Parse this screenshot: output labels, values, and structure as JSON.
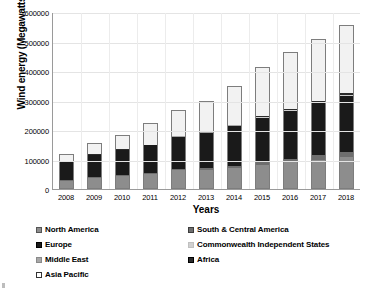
{
  "chart_data": {
    "type": "bar",
    "stacked": true,
    "title": "",
    "xlabel": "Years",
    "ylabel": "Wind energy (Megawatts)",
    "categories": [
      "2008",
      "2009",
      "2010",
      "2011",
      "2012",
      "2013",
      "2014",
      "2015",
      "2016",
      "2017",
      "2018"
    ],
    "ylim": [
      0,
      600000
    ],
    "yticks": [
      "0",
      "100000",
      "200000",
      "300000",
      "400000",
      "500000",
      "600000"
    ],
    "ytick_values": [
      0,
      100000,
      200000,
      300000,
      400000,
      500000,
      600000
    ],
    "grid": "horizontal-and-vertical",
    "legend_position": "below",
    "series": [
      {
        "name": "North America",
        "color": "#8d8d8d",
        "values": [
          25200,
          35600,
          40900,
          48300,
          60900,
          61500,
          68300,
          79500,
          88100,
          95800,
          103600
        ]
      },
      {
        "name": "South & Central America",
        "color": "#6e6e6e",
        "values": [
          600,
          900,
          1900,
          2500,
          3400,
          4800,
          6500,
          8900,
          11700,
          15200,
          19400
        ]
      },
      {
        "name": "Europe",
        "color": "#1a1a1a",
        "values": [
          64900,
          76200,
          86300,
          93700,
          109800,
          121000,
          136000,
          150000,
          163000,
          178000,
          189000
        ]
      },
      {
        "name": "Commonwealth Independent States",
        "color": "#d0d0d0",
        "values": [
          400,
          400,
          400,
          400,
          500,
          600,
          700,
          800,
          900,
          1200,
          1700
        ]
      },
      {
        "name": "Middle East",
        "color": "#a8a8a8",
        "values": [
          200,
          300,
          400,
          500,
          600,
          700,
          800,
          900,
          1000,
          1200,
          1400
        ]
      },
      {
        "name": "Africa",
        "color": "#2b2b2b",
        "values": [
          600,
          800,
          1100,
          1300,
          1500,
          2100,
          2800,
          3400,
          3900,
          4900,
          5700
        ]
      },
      {
        "name": "Asia Pacific",
        "color": "#f2f2f2",
        "values": [
          21400,
          34100,
          46200,
          70800,
          85000,
          102000,
          127000,
          165000,
          188000,
          207000,
          230000
        ]
      }
    ],
    "totals": [
      113300,
      148300,
      177200,
      217500,
      261700,
      292700,
      342100,
      408500,
      456600,
      503300,
      550800
    ]
  },
  "legend": {
    "left_column": [
      {
        "label": "North America",
        "swatch": "#8d8d8d",
        "border": "#555555"
      },
      {
        "label": "Europe",
        "swatch": "#1a1a1a",
        "border": "#000000"
      },
      {
        "label": "Middle East",
        "swatch": "#a8a8a8",
        "border": "#8a8a8a"
      },
      {
        "label": "Asia Pacific",
        "swatch": "#ffffff",
        "border": "#333333"
      }
    ],
    "right_column": [
      {
        "label": "South & Central America",
        "swatch": "#6e6e6e",
        "border": "#3d3d3d"
      },
      {
        "label": "Commonwealth Independent States",
        "swatch": "#d0d0d0",
        "border": "#c0c0c0"
      },
      {
        "label": "Africa",
        "swatch": "#2b2b2b",
        "border": "#000000"
      }
    ]
  },
  "axis_colors": {
    "axis_line": "#9a9a9a",
    "gridline": "#e4e4e4",
    "bar_border": "#7d7d7d"
  }
}
